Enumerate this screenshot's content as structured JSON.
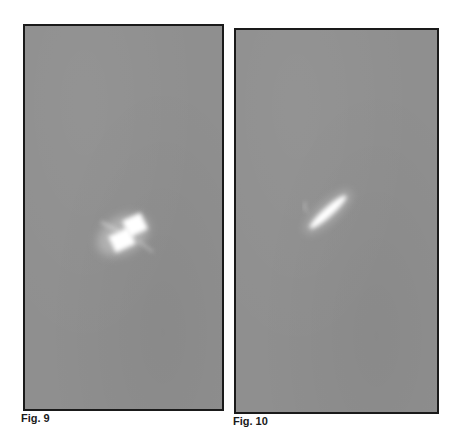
{
  "figures": [
    {
      "label": "Fig. 9",
      "description": "Bright rectangular object with cross-shaped flare on grey background",
      "background_color": "#8f8f8f"
    },
    {
      "label": "Fig. 10",
      "description": "Elongated bright streak object on grey background",
      "background_color": "#8f8f8f"
    }
  ]
}
